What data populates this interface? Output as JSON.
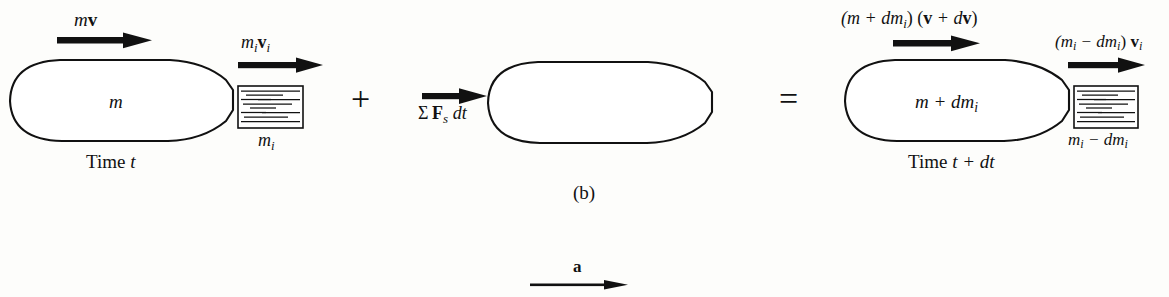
{
  "figure": {
    "caption": "(b)",
    "background_color": "#fdfdfb",
    "ink_color": "#111111",
    "width": 1169,
    "height": 297
  },
  "left_system": {
    "momentum_label_prefix": "m",
    "momentum_label_vector": "v",
    "body_mass_label": "m",
    "exhaust_momentum_mass": "m",
    "exhaust_momentum_mass_sub": "i",
    "exhaust_momentum_vector": "v",
    "exhaust_momentum_vector_sub": "i",
    "fluid_mass_label": "m",
    "fluid_mass_label_sub": "i",
    "time_label": "Time",
    "time_value": "t"
  },
  "operators": {
    "plus": "+",
    "equals": "="
  },
  "impulse_term": {
    "sigma": "Σ",
    "force_symbol": "F",
    "force_sub": "s",
    "differential": "dt"
  },
  "right_system": {
    "momentum_label": "(m + dm",
    "momentum_label_sub": "i",
    "momentum_label_mid": ") (",
    "momentum_vector_1": "v",
    "momentum_label_plus": " + d",
    "momentum_vector_2": "v",
    "momentum_label_end": ")",
    "body_mass_label_pre": "m + dm",
    "body_mass_label_sub": "i",
    "exhaust_label_open": "(m",
    "exhaust_label_sub1": "i",
    "exhaust_label_minus": " − dm",
    "exhaust_label_sub2": "i",
    "exhaust_label_close": ") ",
    "exhaust_vector": "v",
    "exhaust_vector_sub": "i",
    "fluid_mass_pre": "m",
    "fluid_mass_sub1": "i",
    "fluid_mass_minus": " − dm",
    "fluid_mass_sub2": "i",
    "time_label": "Time",
    "time_value": "t + dt"
  },
  "acceleration": {
    "label": "a"
  }
}
